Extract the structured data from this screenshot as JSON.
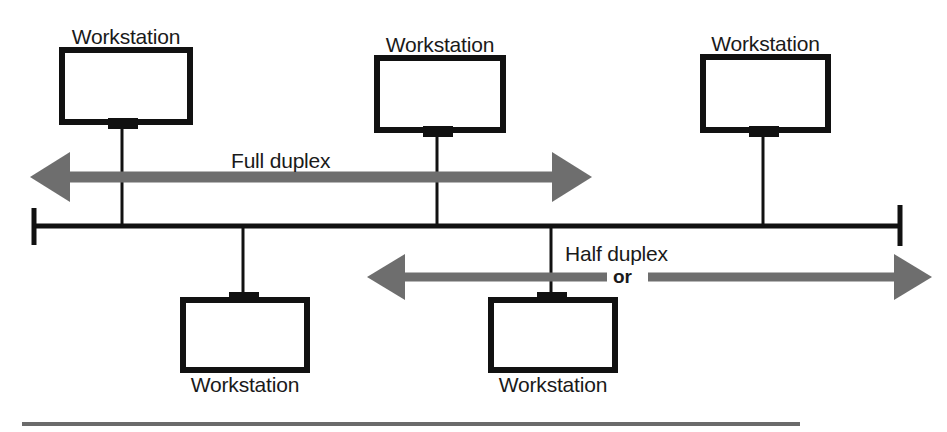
{
  "diagram": {
    "colors": {
      "line": "#111111",
      "arrow": "#6e6e6e",
      "rule": "#6b6b6b",
      "background": "#ffffff",
      "text": "#1a1a1a"
    },
    "workstations": [
      {
        "label": "Workstation",
        "position": "top-left",
        "label_side": "above"
      },
      {
        "label": "Workstation",
        "position": "top-center",
        "label_side": "above"
      },
      {
        "label": "Workstation",
        "position": "top-right",
        "label_side": "above"
      },
      {
        "label": "Workstation",
        "position": "bottom-left",
        "label_side": "below"
      },
      {
        "label": "Workstation",
        "position": "bottom-center",
        "label_side": "below"
      }
    ],
    "flows": [
      {
        "id": "full-duplex",
        "label": "Full duplex",
        "direction": "bidirectional",
        "placement": "above-bus"
      },
      {
        "id": "half-duplex",
        "label": "Half duplex",
        "direction": "bidirectional",
        "placement": "below-bus"
      }
    ],
    "connector": {
      "label": "or"
    },
    "bus": {
      "name": "shared-bus-segment",
      "terminators": 2
    }
  }
}
